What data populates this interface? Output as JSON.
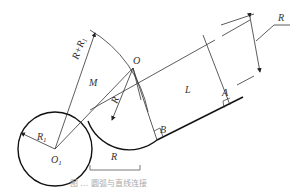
{
  "figure": {
    "type": "geometric construction diagram",
    "labels": {
      "R_dimension": "R",
      "R_plus_R1": "R+R",
      "R_plus_R1_sub": "1",
      "O": "O",
      "M": "M",
      "R_radius": "R",
      "R1": "R",
      "R1_sub": "1",
      "O1": "O",
      "O1_sub": "1",
      "L": "L",
      "A": "A",
      "B": "B",
      "scale_R": "R"
    },
    "caption": "图 ... 圆弧与直线连接"
  },
  "colors": {
    "line": "#333333",
    "thick_line": "#111111",
    "caption": "#aaaaaa"
  }
}
